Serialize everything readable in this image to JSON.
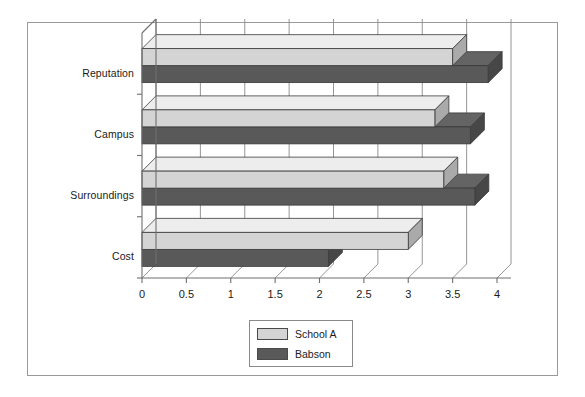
{
  "chart_data": {
    "type": "bar",
    "orientation": "horizontal",
    "style": "3d",
    "title": "",
    "xlabel": "",
    "ylabel": "",
    "categories": [
      "Reputation",
      "Campus",
      "Surroundings",
      "Cost"
    ],
    "series": [
      {
        "name": "School A",
        "values": [
          3.5,
          3.3,
          3.4,
          3.0
        ],
        "color": "#d4d4d4"
      },
      {
        "name": "Babson",
        "values": [
          3.9,
          3.7,
          3.75,
          2.1
        ],
        "color": "#595959"
      }
    ],
    "xlim": [
      0,
      4
    ],
    "xticks": [
      0,
      0.5,
      1,
      1.5,
      2,
      2.5,
      3,
      3.5,
      4
    ],
    "xtick_labels": [
      "0",
      "0.5",
      "1",
      "1.5",
      "2",
      "2.5",
      "3",
      "3.5",
      "4"
    ],
    "grid": true,
    "grid_axis": "x",
    "legend_position": "bottom-center"
  },
  "legend": {
    "entries": [
      {
        "label": "School A",
        "color": "#d4d4d4"
      },
      {
        "label": "Babson",
        "color": "#595959"
      }
    ]
  },
  "colors": {
    "series_school_a": "#d4d4d4",
    "series_babson": "#595959",
    "axis": "#6e6e6e",
    "grid": "#8a8a8a",
    "border": "#9a9a9a",
    "text": "#1a1a1a"
  }
}
